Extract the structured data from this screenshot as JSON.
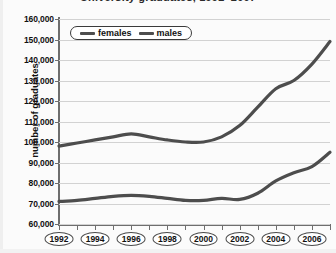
{
  "chart_data": {
    "type": "line",
    "title": "University graduates, 1992–2007",
    "xlabel": "",
    "ylabel": "number of graduates",
    "ylim": [
      60000,
      160000
    ],
    "ytick_step": 10000,
    "ytick_labels": [
      "160,000",
      "150,000",
      "140,000",
      "130,000",
      "120,000",
      "110,000",
      "100,000",
      "90,000",
      "80,000",
      "70,000",
      "60,000"
    ],
    "xlim": [
      1992,
      2007
    ],
    "x": [
      1992,
      1993,
      1994,
      1995,
      1996,
      1997,
      1998,
      1999,
      2000,
      2001,
      2002,
      2003,
      2004,
      2005,
      2006,
      2007
    ],
    "xtick_labels": [
      "1992",
      "1994",
      "1996",
      "1998",
      "2000",
      "2002",
      "2004",
      "2006"
    ],
    "grid": "horizontal",
    "legend_position": "top-left-inside",
    "series": [
      {
        "name": "females",
        "color": "#4d4d4d",
        "values": [
          98000,
          99500,
          101000,
          102500,
          104000,
          102500,
          101000,
          100000,
          100000,
          102500,
          108000,
          117000,
          126000,
          130000,
          138000,
          149000
        ]
      },
      {
        "name": "males",
        "color": "#4d4d4d",
        "values": [
          71000,
          71500,
          72500,
          73500,
          74000,
          73500,
          72500,
          71500,
          71500,
          72500,
          72000,
          75000,
          81000,
          85000,
          88000,
          95000
        ]
      }
    ]
  },
  "legend": {
    "items": [
      {
        "label": "females"
      },
      {
        "label": "males"
      }
    ]
  },
  "axes": {
    "y_title": "number of graduates"
  }
}
